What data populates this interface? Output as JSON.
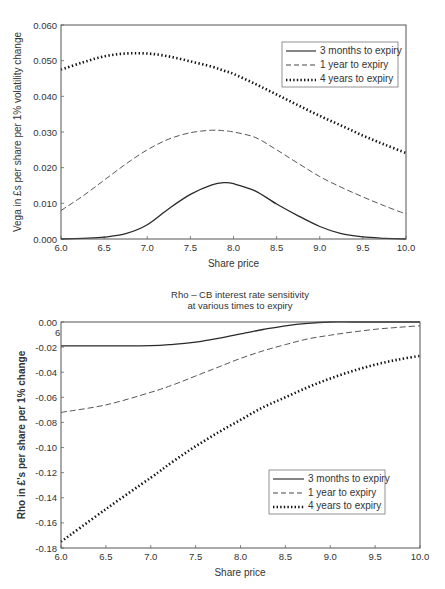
{
  "chart_data": [
    {
      "id": "vega",
      "type": "line",
      "title": "",
      "xlabel": "Share price",
      "ylabel": "Vega in £s per share per 1% volatility change",
      "xlim": [
        6.0,
        10.0
      ],
      "ylim": [
        0.0,
        0.06
      ],
      "x_ticks": [
        "6.0",
        "6.5",
        "7.0",
        "7.5",
        "8.0",
        "8.5",
        "9.0",
        "9.5",
        "10.0"
      ],
      "y_ticks": [
        "0.000",
        "0.010",
        "0.020",
        "0.030",
        "0.040",
        "0.050",
        "0.060"
      ],
      "grid": false,
      "legend_position": "upper right",
      "x": [
        6.0,
        6.25,
        6.5,
        6.75,
        7.0,
        7.25,
        7.5,
        7.75,
        7.9,
        8.0,
        8.25,
        8.5,
        8.75,
        9.0,
        9.25,
        9.5,
        9.75,
        10.0
      ],
      "series": [
        {
          "name": "3 months to expiry",
          "style": "solid",
          "values": [
            0.0,
            0.0002,
            0.0005,
            0.0015,
            0.004,
            0.0085,
            0.0125,
            0.0152,
            0.0158,
            0.0155,
            0.0135,
            0.0098,
            0.0065,
            0.0035,
            0.0015,
            0.0006,
            0.0002,
            0.0
          ]
        },
        {
          "name": "1 year to expiry",
          "style": "dashed",
          "values": [
            0.008,
            0.012,
            0.0165,
            0.021,
            0.025,
            0.028,
            0.0298,
            0.0305,
            0.0303,
            0.03,
            0.0285,
            0.025,
            0.0212,
            0.0175,
            0.0145,
            0.0118,
            0.0093,
            0.007
          ]
        },
        {
          "name": "4 years to expiry",
          "style": "dotted",
          "values": [
            0.0475,
            0.0495,
            0.0512,
            0.052,
            0.052,
            0.0512,
            0.0498,
            0.0483,
            0.0471,
            0.0463,
            0.0435,
            0.0405,
            0.0375,
            0.0345,
            0.0318,
            0.029,
            0.0265,
            0.0241
          ]
        }
      ]
    },
    {
      "id": "rho",
      "type": "line",
      "title": "Rho – CB interest rate sensitivity",
      "subtitle": "at various times to expiry",
      "xlabel": "Share price",
      "ylabel": "Rho in £'s per share per 1% change",
      "xlim": [
        6.0,
        10.0
      ],
      "ylim": [
        -0.18,
        0.0
      ],
      "x_ticks": [
        "6.0",
        "6.5",
        "7.0",
        "7.5",
        "8.0",
        "8.5",
        "9.0",
        "9.5",
        "10.0"
      ],
      "y_ticks": [
        "0.00",
        "-0.02",
        "-0.04",
        "-0.06",
        "-0.08",
        "-0.10",
        "-0.12",
        "-0.14",
        "-0.16",
        "-0.18"
      ],
      "stray_label": "6",
      "grid": false,
      "legend_position": "lower right",
      "x": [
        6.0,
        6.5,
        7.0,
        7.25,
        7.5,
        7.75,
        8.0,
        8.25,
        8.5,
        8.75,
        9.0,
        9.25,
        9.5,
        9.75,
        10.0
      ],
      "series": [
        {
          "name": "3 months to expiry",
          "style": "solid",
          "values": [
            -0.019,
            -0.019,
            -0.0188,
            -0.0178,
            -0.016,
            -0.013,
            -0.0095,
            -0.006,
            -0.003,
            -0.001,
            0.0,
            0.0,
            0.0,
            0.0,
            0.0
          ]
        },
        {
          "name": "1 year to expiry",
          "style": "dashed",
          "values": [
            -0.072,
            -0.066,
            -0.056,
            -0.05,
            -0.043,
            -0.036,
            -0.029,
            -0.023,
            -0.018,
            -0.0135,
            -0.0105,
            -0.008,
            -0.0058,
            -0.0043,
            -0.003
          ]
        },
        {
          "name": "4 years to expiry",
          "style": "dotted",
          "values": [
            -0.175,
            -0.149,
            -0.124,
            -0.111,
            -0.099,
            -0.088,
            -0.078,
            -0.068,
            -0.06,
            -0.052,
            -0.045,
            -0.039,
            -0.034,
            -0.03,
            -0.027
          ]
        }
      ]
    }
  ]
}
